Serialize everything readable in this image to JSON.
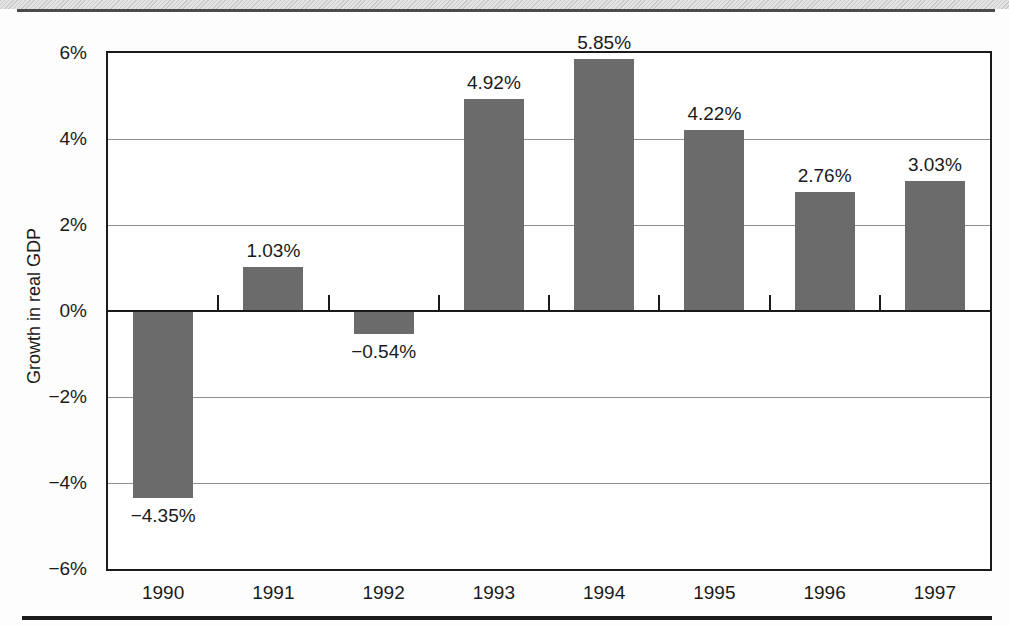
{
  "colors": {
    "bar_fill": "#6b6b6b",
    "axis_line": "#1a1a1a",
    "gridline": "#8f8f8f",
    "top_band": "#d9d9d9",
    "top_rule": "#4b4b4b",
    "bottom_rule": "#1b1b1b",
    "text": "#1a1a1a"
  },
  "chart_data": {
    "type": "bar",
    "title": "",
    "xlabel": "",
    "ylabel": "Growth in real GDP",
    "categories": [
      "1990",
      "1991",
      "1992",
      "1993",
      "1994",
      "1995",
      "1996",
      "1997"
    ],
    "values": [
      -4.35,
      1.03,
      -0.54,
      4.92,
      5.85,
      4.22,
      2.76,
      3.03
    ],
    "bar_labels": [
      "−4.35%",
      "1.03%",
      "−0.54%",
      "4.92%",
      "5.85%",
      "4.22%",
      "2.76%",
      "3.03%"
    ],
    "ylim": [
      -6,
      6
    ],
    "ytick_values": [
      6,
      4,
      2,
      0,
      -2,
      -4,
      -6
    ],
    "ytick_labels": [
      "6%",
      "4%",
      "2%",
      "0%",
      "−2%",
      "−4%",
      "−6%"
    ],
    "grid": "horizontal",
    "legend": "none"
  }
}
